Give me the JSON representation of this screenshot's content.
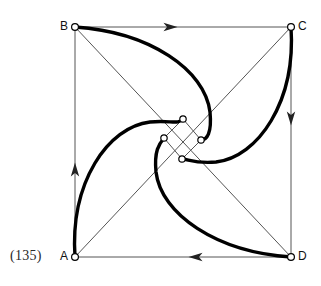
{
  "figure": {
    "caption": "(135)",
    "caption_pos": {
      "x": 10,
      "y": 248
    },
    "canvas": {
      "width": 321,
      "height": 286
    },
    "colors": {
      "thin_line": "#555555",
      "thick_curve": "#000000",
      "node_fill": "#ffffff",
      "node_stroke": "#000000",
      "label_text": "#111111",
      "caption_text": "#2a2a2a",
      "background": "#ffffff"
    },
    "stroke_widths": {
      "thin": 1.0,
      "thick": 3.4,
      "node": 1.2
    },
    "square": {
      "name": "ABCD",
      "vertices": [
        {
          "id": "A",
          "label": "A",
          "x": 75,
          "y": 257,
          "label_x": 60,
          "label_y": 250
        },
        {
          "id": "B",
          "label": "B",
          "x": 75,
          "y": 27,
          "label_x": 60,
          "label_y": 20
        },
        {
          "id": "C",
          "label": "C",
          "x": 291,
          "y": 27,
          "label_x": 298,
          "label_y": 20
        },
        {
          "id": "D",
          "label": "D",
          "x": 291,
          "y": 257,
          "label_x": 298,
          "label_y": 250
        }
      ],
      "edges": [
        {
          "id": "AB",
          "from": "A",
          "to": "B",
          "direction": "up",
          "arrow_at": {
            "x": 75,
            "y": 170
          }
        },
        {
          "id": "BC",
          "from": "B",
          "to": "C",
          "direction": "right",
          "arrow_at": {
            "x": 170,
            "y": 27
          }
        },
        {
          "id": "CD",
          "from": "C",
          "to": "D",
          "direction": "down",
          "arrow_at": {
            "x": 291,
            "y": 118
          }
        },
        {
          "id": "DA",
          "from": "D",
          "to": "A",
          "direction": "left",
          "arrow_at": {
            "x": 196,
            "y": 257
          }
        }
      ],
      "diagonals": [
        {
          "id": "AC",
          "from": "A",
          "to": "C"
        },
        {
          "id": "BD",
          "from": "B",
          "to": "D"
        }
      ]
    },
    "inner_square": {
      "name": "inner-node-square",
      "nodes": [
        {
          "id": "n-top",
          "x": 183,
          "y": 119
        },
        {
          "id": "n-left",
          "x": 164,
          "y": 138
        },
        {
          "id": "n-right",
          "x": 201,
          "y": 140
        },
        {
          "id": "n-bottom",
          "x": 182,
          "y": 159
        }
      ],
      "edges": [
        {
          "from": "n-left",
          "to": "n-top"
        },
        {
          "from": "n-top",
          "to": "n-right"
        },
        {
          "from": "n-right",
          "to": "n-bottom"
        },
        {
          "from": "n-bottom",
          "to": "n-left"
        }
      ],
      "node_radius": 3.2
    },
    "spiral_curves": [
      {
        "id": "curve-B",
        "from": "B",
        "to": "n-right",
        "path": "M 75 27 C 150 32 205 70 210 112 C 212 133 207 140 201 140"
      },
      {
        "id": "curve-C",
        "from": "C",
        "to": "n-bottom",
        "path": "M 291 27 C 296 102 258 157 216 162 C 195 164 188 159 182 159"
      },
      {
        "id": "curve-D",
        "from": "D",
        "to": "n-left",
        "path": "M 291 257 C 216 252 161 214 156 172 C 154 151 159 144 164 138"
      },
      {
        "id": "curve-A",
        "from": "A",
        "to": "n-top",
        "path": "M 75 257 C 70 182 108 127 150 122 C 171 120 178 125 183 119"
      }
    ]
  }
}
